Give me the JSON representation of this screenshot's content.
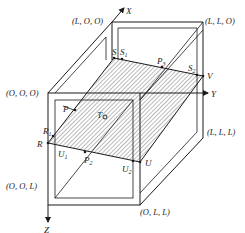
{
  "diagram": {
    "type": "3d-box-cross-section",
    "axes": {
      "x": "X",
      "y": "Y",
      "z": "Z"
    },
    "corner_labels": {
      "origin": "(O, O, O)",
      "lOO": "(L, O, O)",
      "llO": "(L, L, O)",
      "lll": "(L, L, L)",
      "ool": "(O, O, L)",
      "oll": "(O, L, L)"
    },
    "points": {
      "S": "S",
      "S1": "S",
      "S1_sub": "1",
      "P3": "P",
      "P3_sub": "3",
      "S2": "S",
      "S2_sub": "2",
      "V": "V",
      "P": "P",
      "P_sub": "1",
      "T": "T",
      "R1": "R",
      "R1_sub": "1",
      "R": "R",
      "U1": "U",
      "U1_sub": "1",
      "P2": "P",
      "P2_sub": "2",
      "U2": "U",
      "U2_sub": "2",
      "U": "U"
    },
    "colors": {
      "line": "#1a1a1a",
      "hatch": "#555555",
      "background": "#ffffff"
    }
  }
}
